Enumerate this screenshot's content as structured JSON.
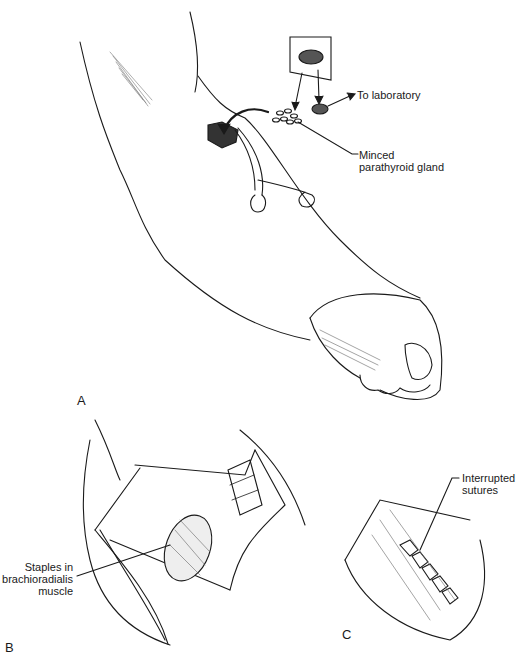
{
  "figure": {
    "panels": [
      {
        "id": "A",
        "label": "A",
        "description": "Forearm with incision and retractor; parathyroid gland minced and implanted"
      },
      {
        "id": "B",
        "label": "B",
        "description": "Exposed brachioradialis muscle with staples"
      },
      {
        "id": "C",
        "label": "C",
        "description": "Closure with interrupted sutures"
      }
    ],
    "annotations": {
      "to_laboratory": "To laboratory",
      "minced_line1": "Minced",
      "minced_line2": "parathyroid gland",
      "staples_line1": "Staples in",
      "staples_line2": "brachioradialis",
      "staples_line3": "muscle",
      "interrupted_line1": "Interrupted",
      "interrupted_line2": "sutures"
    },
    "colors": {
      "ink": "#1a1a1a",
      "background": "#ffffff",
      "shade": "#555555"
    }
  }
}
